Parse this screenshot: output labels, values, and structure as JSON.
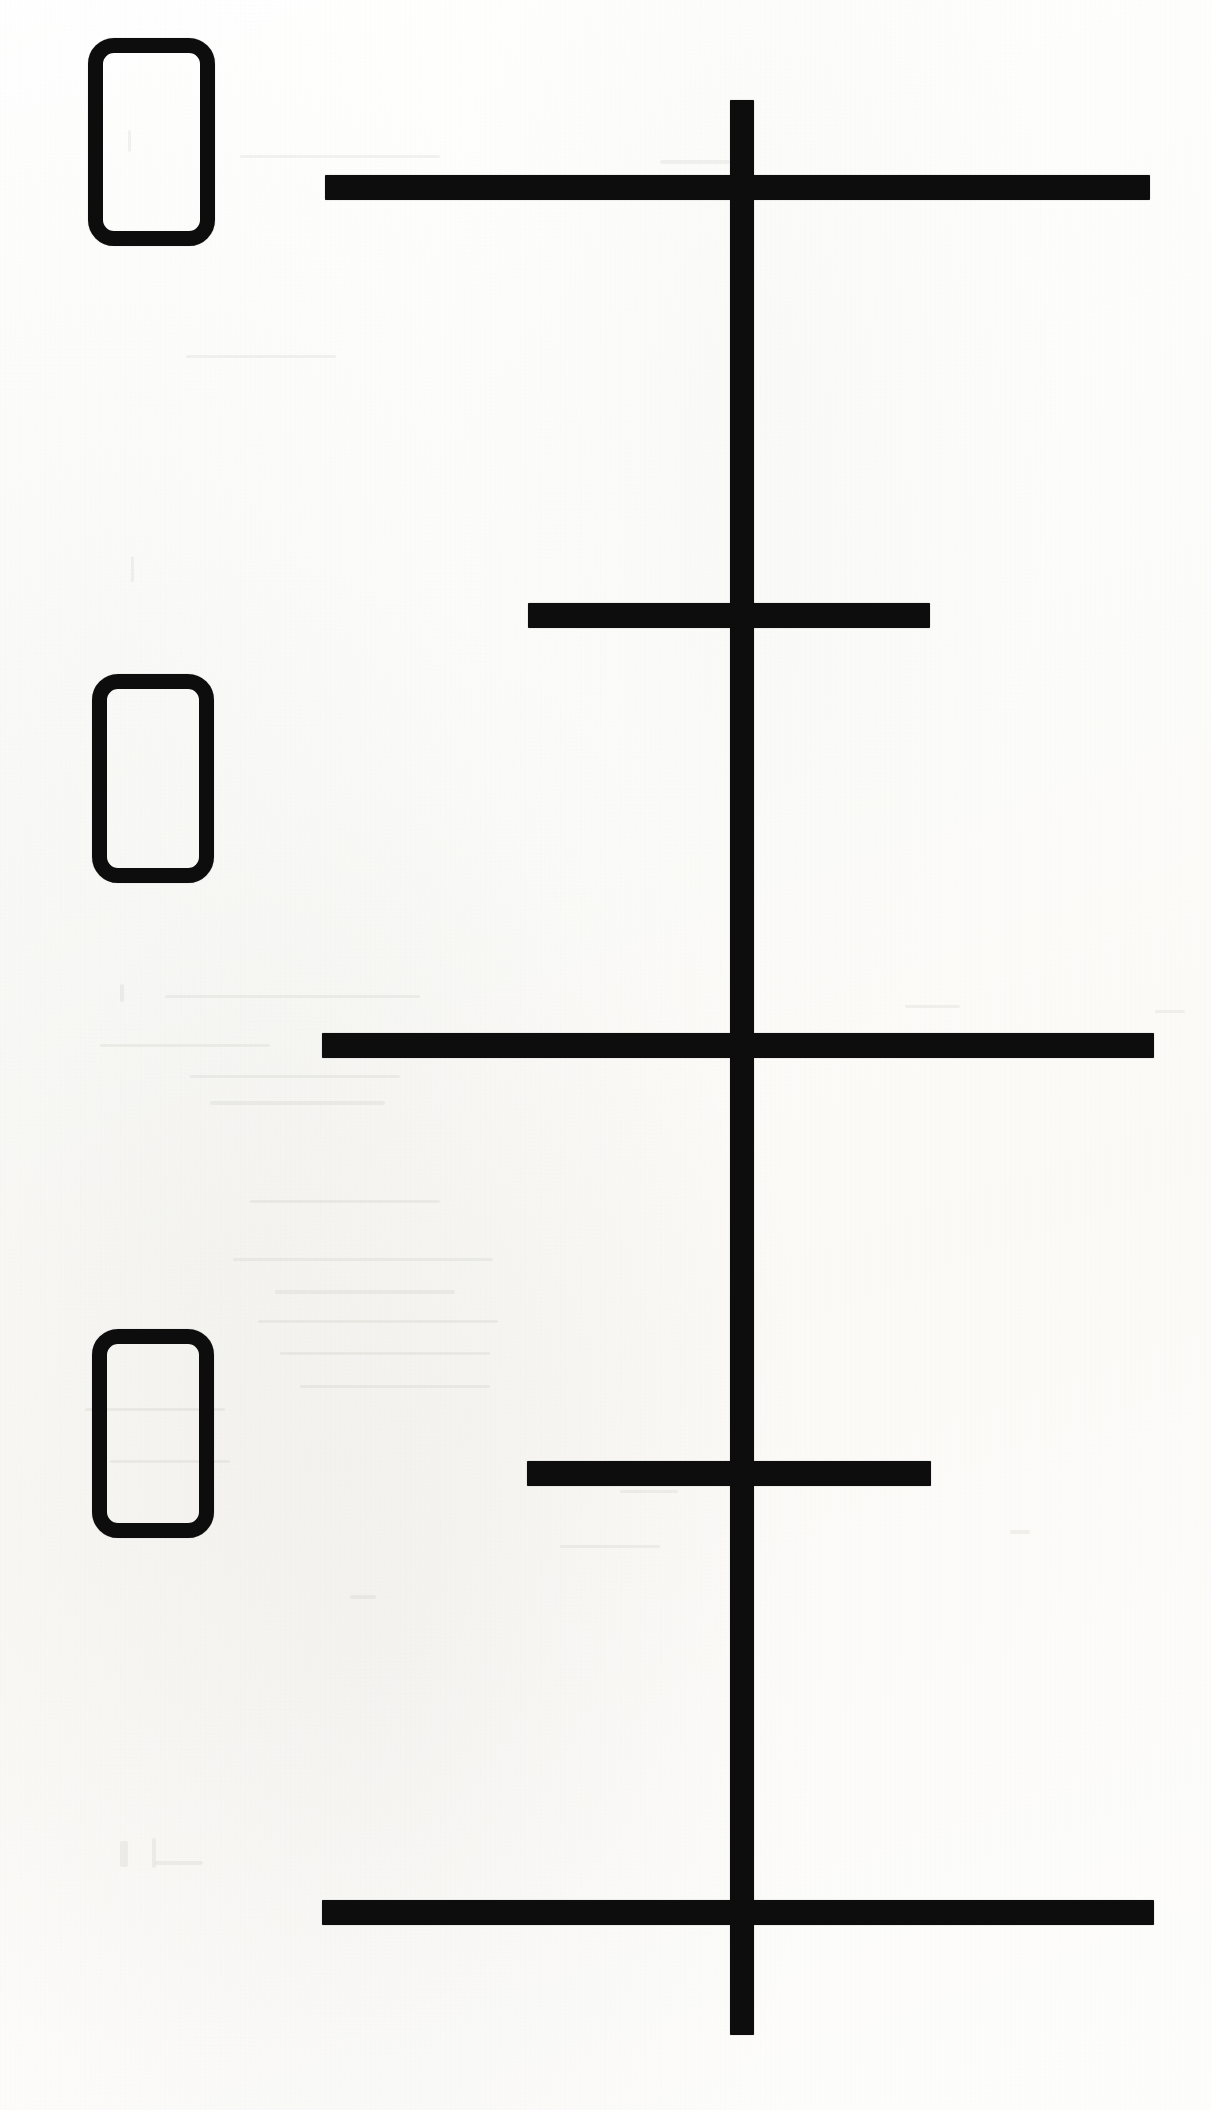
{
  "document": {
    "kind": "scanned-line-diagram",
    "page_width": 1211,
    "page_height": 2110,
    "background_color": "#fdfdfb",
    "ink_color": "#0d0d0d",
    "visible_text": "",
    "note": ""
  },
  "diagram": {
    "title": "",
    "stem": {
      "name": "vertical-axis-stroke",
      "x": 730,
      "y": 100,
      "width": 24,
      "height": 1935,
      "color": "#0d0d0d"
    },
    "bars": [
      {
        "name": "horizontal-stroke-1",
        "label": "",
        "x": 325,
        "y": 175,
        "width": 825,
        "height": 25,
        "span": "long",
        "color": "#0d0d0d"
      },
      {
        "name": "horizontal-stroke-2",
        "label": "",
        "x": 528,
        "y": 603,
        "width": 402,
        "height": 25,
        "span": "short",
        "color": "#0d0d0d"
      },
      {
        "name": "horizontal-stroke-3",
        "label": "",
        "x": 322,
        "y": 1033,
        "width": 832,
        "height": 25,
        "span": "long",
        "color": "#0d0d0d"
      },
      {
        "name": "horizontal-stroke-4",
        "label": "",
        "x": 527,
        "y": 1461,
        "width": 404,
        "height": 25,
        "span": "short",
        "color": "#0d0d0d"
      },
      {
        "name": "horizontal-stroke-5",
        "label": "",
        "x": 322,
        "y": 1900,
        "width": 832,
        "height": 25,
        "span": "long",
        "color": "#0d0d0d"
      }
    ],
    "boxes": [
      {
        "name": "rounded-box-1",
        "label": "",
        "x": 88,
        "y": 38,
        "width": 127,
        "height": 208,
        "border": 15,
        "radius": 26,
        "color": "#0d0d0d"
      },
      {
        "name": "rounded-box-2",
        "label": "",
        "x": 92,
        "y": 674,
        "width": 122,
        "height": 209,
        "border": 15,
        "radius": 26,
        "color": "#0d0d0d"
      },
      {
        "name": "rounded-box-3",
        "label": "",
        "x": 92,
        "y": 1329,
        "width": 122,
        "height": 209,
        "border": 15,
        "radius": 26,
        "color": "#0d0d0d"
      }
    ],
    "ghost_marks": [
      {
        "name": "ghost-smudge-1",
        "x": 240,
        "y": 155,
        "width": 200,
        "height": 3
      },
      {
        "name": "ghost-smudge-2",
        "x": 660,
        "y": 160,
        "width": 70,
        "height": 4
      },
      {
        "name": "ghost-smudge-3",
        "x": 128,
        "y": 130,
        "width": 3,
        "height": 22
      },
      {
        "name": "ghost-smudge-4",
        "x": 186,
        "y": 355,
        "width": 150,
        "height": 3
      },
      {
        "name": "ghost-smudge-5",
        "x": 131,
        "y": 556,
        "width": 3,
        "height": 26
      },
      {
        "name": "ghost-smudge-6",
        "x": 120,
        "y": 984,
        "width": 4,
        "height": 18
      },
      {
        "name": "ghost-smudge-7",
        "x": 165,
        "y": 995,
        "width": 255,
        "height": 3
      },
      {
        "name": "ghost-smudge-8",
        "x": 100,
        "y": 1044,
        "width": 170,
        "height": 3
      },
      {
        "name": "ghost-smudge-9",
        "x": 190,
        "y": 1075,
        "width": 210,
        "height": 3
      },
      {
        "name": "ghost-smudge-10",
        "x": 210,
        "y": 1101,
        "width": 175,
        "height": 4
      },
      {
        "name": "ghost-smudge-11",
        "x": 250,
        "y": 1200,
        "width": 190,
        "height": 3
      },
      {
        "name": "ghost-smudge-12",
        "x": 233,
        "y": 1258,
        "width": 260,
        "height": 3
      },
      {
        "name": "ghost-smudge-13",
        "x": 275,
        "y": 1290,
        "width": 180,
        "height": 4
      },
      {
        "name": "ghost-smudge-14",
        "x": 258,
        "y": 1320,
        "width": 240,
        "height": 3
      },
      {
        "name": "ghost-smudge-15",
        "x": 280,
        "y": 1352,
        "width": 210,
        "height": 3
      },
      {
        "name": "ghost-smudge-16",
        "x": 300,
        "y": 1385,
        "width": 190,
        "height": 3
      },
      {
        "name": "ghost-smudge-17",
        "x": 85,
        "y": 1408,
        "width": 140,
        "height": 3
      },
      {
        "name": "ghost-smudge-18",
        "x": 110,
        "y": 1460,
        "width": 120,
        "height": 3
      },
      {
        "name": "ghost-smudge-19",
        "x": 905,
        "y": 1005,
        "width": 55,
        "height": 3
      },
      {
        "name": "ghost-smudge-20",
        "x": 1155,
        "y": 1010,
        "width": 30,
        "height": 3
      },
      {
        "name": "ghost-smudge-21",
        "x": 120,
        "y": 1841,
        "width": 8,
        "height": 26
      },
      {
        "name": "ghost-smudge-22",
        "x": 152,
        "y": 1838,
        "width": 4,
        "height": 30
      },
      {
        "name": "ghost-smudge-23",
        "x": 155,
        "y": 1861,
        "width": 48,
        "height": 4
      },
      {
        "name": "ghost-smudge-24",
        "x": 350,
        "y": 1595,
        "width": 26,
        "height": 4
      },
      {
        "name": "ghost-smudge-25",
        "x": 560,
        "y": 1545,
        "width": 100,
        "height": 3
      },
      {
        "name": "ghost-smudge-26",
        "x": 620,
        "y": 1490,
        "width": 58,
        "height": 3
      },
      {
        "name": "ghost-smudge-27",
        "x": 1010,
        "y": 1530,
        "width": 20,
        "height": 4
      }
    ]
  }
}
